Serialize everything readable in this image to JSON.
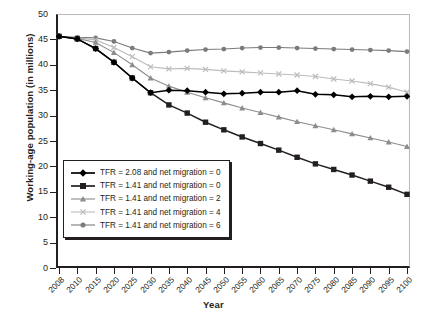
{
  "chart_data": {
    "type": "line",
    "title": "",
    "xlabel": "Year",
    "ylabel": "Working-age population (in millions)",
    "xlim": [
      2008,
      2100
    ],
    "ylim": [
      0,
      50
    ],
    "ytick_values": [
      0,
      5,
      10,
      15,
      20,
      25,
      30,
      35,
      40,
      45,
      50
    ],
    "ytick_labels": [
      "0",
      "5",
      "10",
      "15",
      "20",
      "25",
      "30",
      "35",
      "40",
      "45",
      "50"
    ],
    "grid": false,
    "legend_position": "lower-left-inside",
    "categories": [
      2008,
      2010,
      2015,
      2020,
      2025,
      2030,
      2035,
      2040,
      2045,
      2050,
      2055,
      2060,
      2065,
      2070,
      2075,
      2080,
      2085,
      2090,
      2095,
      2100
    ],
    "xtick_labels": [
      "2008",
      "2010",
      "2015",
      "2020",
      "2025",
      "2030",
      "2035",
      "2040",
      "2045",
      "2050",
      "2055",
      "2060",
      "2065",
      "2070",
      "2075",
      "2080",
      "2085",
      "2090",
      "2095",
      "2100"
    ],
    "series": [
      {
        "name": "TFR = 2.08 and net migration = 0",
        "marker": "diamond",
        "color": "#000000",
        "values": [
          45.6,
          45.1,
          43.2,
          40.5,
          37.4,
          34.5,
          35.0,
          34.9,
          34.6,
          34.3,
          34.4,
          34.6,
          34.6,
          34.9,
          34.2,
          34.1,
          33.7,
          33.8,
          33.7,
          33.8
        ]
      },
      {
        "name": "TFR = 1.41 and net migration = 0",
        "marker": "square",
        "color": "#231f20",
        "values": [
          45.6,
          45.1,
          43.2,
          40.5,
          37.4,
          34.5,
          32.1,
          30.5,
          28.7,
          27.2,
          25.8,
          24.5,
          23.2,
          21.8,
          20.5,
          19.4,
          18.3,
          17.1,
          15.9,
          14.5
        ]
      },
      {
        "name": "TFR = 1.41 and net migration = 2",
        "marker": "triangle",
        "color": "#8d8d8d",
        "values": [
          45.6,
          45.2,
          44.4,
          42.4,
          40.0,
          37.4,
          35.8,
          34.6,
          33.5,
          32.5,
          31.5,
          30.6,
          29.7,
          28.8,
          28.0,
          27.2,
          26.4,
          25.6,
          24.8,
          23.9
        ]
      },
      {
        "name": "TFR = 1.41 and net migration = 4",
        "marker": "x",
        "color": "#bcbcbc",
        "values": [
          45.6,
          45.3,
          44.9,
          43.4,
          41.6,
          39.6,
          39.2,
          39.3,
          39.1,
          38.8,
          38.6,
          38.4,
          38.2,
          38.0,
          37.7,
          37.2,
          36.8,
          36.3,
          35.6,
          34.6
        ]
      },
      {
        "name": "TFR = 1.41 and net migration = 6",
        "marker": "circle",
        "color": "#7b7b7b",
        "values": [
          45.6,
          45.4,
          45.3,
          44.6,
          43.3,
          42.3,
          42.5,
          42.8,
          43.0,
          43.1,
          43.3,
          43.4,
          43.4,
          43.3,
          43.2,
          43.1,
          43.0,
          42.9,
          42.8,
          42.6
        ]
      }
    ]
  },
  "legend": {
    "items": [
      "TFR = 2.08 and net migration = 0",
      "TFR = 1.41 and net migration = 0",
      "TFR = 1.41 and net migration = 2",
      "TFR = 1.41 and net migration = 4",
      "TFR = 1.41 and net migration = 6"
    ]
  }
}
